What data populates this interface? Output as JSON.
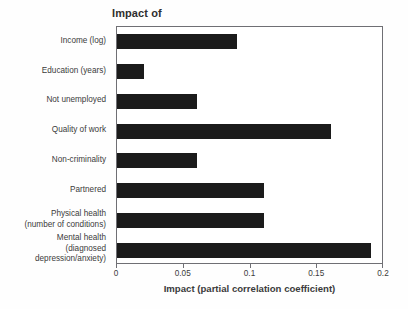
{
  "chart_data": {
    "type": "bar",
    "orientation": "horizontal",
    "title": "Impact of",
    "xlabel": "Impact (partial correlation coefficient)",
    "ylabel": "",
    "xlim": [
      0,
      0.2
    ],
    "xticks": [
      "0",
      "0.05",
      "0.1",
      "0.15",
      "0.2"
    ],
    "xtick_values": [
      0,
      0.05,
      0.1,
      0.15,
      0.2
    ],
    "grid": false,
    "legend": null,
    "bar_color": "#1b1b1b",
    "categories": [
      "Income (log)",
      "Education (years)",
      "Not unemployed",
      "Quality of work",
      "Non-criminality",
      "Partnered",
      "Physical health\n(number of conditions)",
      "Mental health\n(diagnosed\ndepression/anxiety)"
    ],
    "values": [
      0.09,
      0.02,
      0.06,
      0.16,
      0.06,
      0.11,
      0.11,
      0.19
    ]
  }
}
